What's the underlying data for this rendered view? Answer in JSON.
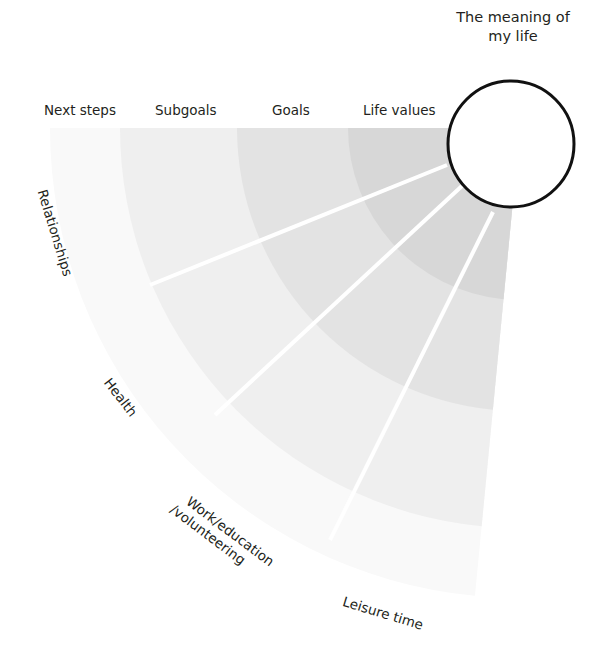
{
  "diagram": {
    "type": "radial-fan",
    "center": {
      "label_line1": "The meaning of",
      "label_line2": "my life"
    },
    "rings": [
      {
        "name": "Life values",
        "color": "#d7d7d7"
      },
      {
        "name": "Goals",
        "color": "#e3e3e3"
      },
      {
        "name": "Subgoals",
        "color": "#efefef"
      },
      {
        "name": "Next steps",
        "color": "#f9f9f9"
      }
    ],
    "sectors": [
      {
        "name": "Relationships"
      },
      {
        "name": "Health"
      },
      {
        "name": "Work/education /volunteering",
        "line1": "Work/education",
        "line2": "/volunteering"
      },
      {
        "name": "Leisure time"
      }
    ],
    "colors": {
      "circle_stroke": "#111111",
      "spoke": "#ffffff",
      "text": "#231f20"
    }
  }
}
